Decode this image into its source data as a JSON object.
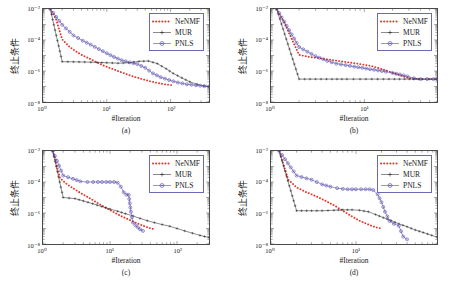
{
  "figure": {
    "ylabel": "终止条件",
    "xlabel": "#Iteration",
    "legend": [
      {
        "name": "NeNMF",
        "color": "#e8352a",
        "style": "dotted-thick",
        "marker": "none"
      },
      {
        "name": "MUR",
        "color": "#2a2a2a",
        "style": "solid-thin",
        "marker": "plus"
      },
      {
        "name": "PNLS",
        "color": "#4a3fa8",
        "style": "solid-thin",
        "marker": "circle"
      }
    ]
  },
  "chart_data": [
    {
      "type": "line",
      "panel": "(a)",
      "title": "",
      "xlabel": "#Iteration",
      "ylabel": "终止条件",
      "xscale": "log",
      "yscale": "log",
      "xlim": [
        1,
        400
      ],
      "ylim": [
        1e-08,
        0.01
      ],
      "xticks": [
        1,
        10,
        100
      ],
      "xticklabels": [
        "10⁰",
        "10¹",
        "10²"
      ],
      "yticks": [
        0.01,
        0.0001,
        1e-06,
        1e-08
      ],
      "yticklabels": [
        "10⁻²",
        "10⁻⁴",
        "10⁻⁶",
        "10⁻⁸"
      ],
      "grid": false,
      "legend_position": "upper-right",
      "series": [
        {
          "name": "NeNMF",
          "color": "#e8352a",
          "x": [
            1.3,
            1.6,
            2,
            2.6,
            3.3,
            4.2,
            5.5,
            7,
            9,
            12,
            16,
            21,
            27,
            36,
            47,
            62,
            80,
            105
          ],
          "y": [
            0.01,
            0.0022,
            0.00011,
            3.6e-05,
            1.8e-05,
            1e-05,
            6e-06,
            3.6e-06,
            2.2e-06,
            1.4e-06,
            9e-07,
            6e-07,
            4.2e-07,
            3e-07,
            2.2e-07,
            1.7e-07,
            1.4e-07,
            1.2e-07
          ]
        },
        {
          "name": "MUR",
          "color": "#2a2a2a",
          "x": [
            1.3,
            2,
            3,
            4.5,
            7,
            10,
            15,
            22,
            32,
            45,
            62,
            85,
            110,
            150,
            200,
            260,
            330,
            400
          ],
          "y": [
            0.01,
            4e-06,
            3.9e-06,
            3.8e-06,
            3.6e-06,
            3.4e-06,
            3.2e-06,
            3.4e-06,
            4.2e-06,
            4.4e-06,
            3e-06,
            1.4e-06,
            7e-07,
            3.6e-07,
            2e-07,
            1.4e-07,
            1.1e-07,
            1e-07
          ]
        },
        {
          "name": "PNLS",
          "color": "#4a3fa8",
          "x": [
            1.3,
            2,
            3,
            4.2,
            5.6,
            7.5,
            10,
            13,
            17,
            23,
            30,
            40,
            53,
            70,
            95,
            130,
            180,
            250,
            340,
            400
          ],
          "y": [
            0.01,
            0.00095,
            0.0002,
            9e-05,
            5e-05,
            2.6e-05,
            1.4e-05,
            8e-06,
            5e-06,
            3.6e-06,
            2.8e-06,
            1.6e-06,
            7e-07,
            4e-07,
            2.6e-07,
            1.8e-07,
            1.4e-07,
            1.2e-07,
            1.05e-07,
            1e-07
          ]
        }
      ]
    },
    {
      "type": "line",
      "panel": "(b)",
      "title": "",
      "xlabel": "#Iteration",
      "ylabel": "终止条件",
      "xscale": "log",
      "yscale": "log",
      "xlim": [
        1,
        60
      ],
      "ylim": [
        1e-08,
        0.01
      ],
      "xticks": [
        1,
        10
      ],
      "xticklabels": [
        "10⁰",
        "10¹"
      ],
      "yticks": [
        0.01,
        0.0001,
        1e-06,
        1e-08
      ],
      "yticklabels": [
        "10⁻²",
        "10⁻⁴",
        "10⁻⁶",
        "10⁻⁸"
      ],
      "grid": false,
      "legend_position": "upper-right",
      "series": [
        {
          "name": "NeNMF",
          "color": "#e8352a",
          "x": [
            1.15,
            1.4,
            1.7,
            2,
            2.6,
            3.4,
            4.4,
            5.6,
            7.2,
            9,
            11.5,
            14,
            17,
            21,
            26,
            32,
            40,
            50,
            60
          ],
          "y": [
            0.01,
            0.0012,
            9e-05,
            1.1e-05,
            8e-06,
            6.5e-06,
            5.2e-06,
            4.2e-06,
            3.4e-06,
            2.8e-06,
            2.2e-06,
            1.6e-06,
            1.1e-06,
            7e-07,
            4.5e-07,
            3.2e-07,
            3e-07,
            3e-07,
            3e-07
          ]
        },
        {
          "name": "MUR",
          "color": "#2a2a2a",
          "x": [
            1.15,
            2,
            3,
            4.5,
            6.5,
            9,
            12,
            16,
            21,
            27,
            34,
            42,
            50,
            60
          ],
          "y": [
            0.01,
            3e-07,
            3e-07,
            3e-07,
            3e-07,
            3e-07,
            3e-07,
            3e-07,
            3e-07,
            3e-07,
            3e-07,
            3e-07,
            3e-07,
            3e-07
          ]
        },
        {
          "name": "PNLS",
          "color": "#4a3fa8",
          "x": [
            1.15,
            2,
            3,
            4,
            5,
            6.3,
            7.8,
            9.5,
            11.5,
            14,
            17,
            20,
            24,
            29,
            34,
            40,
            47,
            55,
            60
          ],
          "y": [
            0.01,
            3.5e-05,
            9e-06,
            4.5e-06,
            3e-06,
            2.4e-06,
            1.9e-06,
            1.6e-06,
            1.3e-06,
            1.1e-06,
            9e-07,
            7.5e-07,
            6e-07,
            4.5e-07,
            3.4e-07,
            3e-07,
            3e-07,
            3e-07,
            3e-07
          ]
        }
      ]
    },
    {
      "type": "line",
      "panel": "(c)",
      "title": "",
      "xlabel": "#Iteration",
      "ylabel": "终止条件",
      "xscale": "log",
      "yscale": "log",
      "xlim": [
        1,
        300
      ],
      "ylim": [
        1e-08,
        0.01
      ],
      "xticks": [
        1,
        10,
        100
      ],
      "xticklabels": [
        "10⁰",
        "10¹",
        "10²"
      ],
      "yticks": [
        0.01,
        0.0001,
        1e-06,
        1e-08
      ],
      "yticklabels": [
        "10⁻²",
        "10⁻⁴",
        "10⁻⁶",
        "10⁻⁸"
      ],
      "grid": false,
      "legend_position": "upper-right",
      "series": [
        {
          "name": "NeNMF",
          "color": "#e8352a",
          "x": [
            1.4,
            1.8,
            2.2,
            2.8,
            3.6,
            4.6,
            6,
            7.6,
            9.6,
            12,
            15,
            19,
            24,
            30,
            38,
            46
          ],
          "y": [
            0.01,
            0.00018,
            8e-05,
            4e-05,
            2e-05,
            1.1e-05,
            5.5e-06,
            3e-06,
            1.7e-06,
            1e-06,
            6e-07,
            3.8e-07,
            2.4e-07,
            1.6e-07,
            1.1e-07,
            9e-08
          ]
        },
        {
          "name": "MUR",
          "color": "#2a2a2a",
          "x": [
            1.4,
            2,
            3,
            4,
            5.5,
            7.5,
            10,
            13,
            17,
            22,
            28,
            36,
            46,
            60,
            78,
            100,
            130,
            170,
            220,
            300
          ],
          "y": [
            0.01,
            1e-05,
            8.5e-06,
            6e-06,
            4e-06,
            2.6e-06,
            1.8e-06,
            1.3e-06,
            9e-07,
            6.5e-07,
            4.5e-07,
            3.2e-07,
            2.4e-07,
            1.8e-07,
            1.4e-07,
            1e-07,
            7e-08,
            5e-08,
            3.6e-08,
            2.6e-08
          ]
        },
        {
          "name": "PNLS",
          "color": "#4a3fa8",
          "x": [
            1.4,
            2,
            2.8,
            3.6,
            4.6,
            5.6,
            6.6,
            7.6,
            8.8,
            10,
            11.5,
            13,
            14.5,
            16,
            17.5,
            19,
            20.5,
            22,
            24,
            26,
            28,
            31
          ],
          "y": [
            0.01,
            0.00026,
            0.00016,
            0.00011,
            0.0001,
            0.0001,
            0.0001,
            0.0001,
            0.0001,
            0.0001,
            0.0001,
            9e-05,
            5e-05,
            2.2e-05,
            1.5e-05,
            1.5e-05,
            1.2e-06,
            2.4e-07,
            1.6e-07,
            1.2e-07,
            9e-08,
            7e-08
          ]
        }
      ]
    },
    {
      "type": "line",
      "panel": "(d)",
      "title": "",
      "xlabel": "#Iteration",
      "ylabel": "终止条件",
      "xscale": "log",
      "yscale": "log",
      "xlim": [
        1,
        90
      ],
      "ylim": [
        1e-08,
        0.01
      ],
      "xticks": [
        1,
        10
      ],
      "xticklabels": [
        "10⁰",
        "10¹"
      ],
      "yticks": [
        0.01,
        0.0001,
        1e-06,
        1e-08
      ],
      "yticklabels": [
        "10⁻²",
        "10⁻⁴",
        "10⁻⁶",
        "10⁻⁸"
      ],
      "grid": false,
      "legend_position": "upper-right",
      "series": [
        {
          "name": "NeNMF",
          "color": "#e8352a",
          "x": [
            1.25,
            1.6,
            2,
            2.6,
            3.4,
            4.4,
            5.6,
            7,
            9,
            11,
            14,
            17,
            20
          ],
          "y": [
            0.01,
            0.00014,
            4.5e-05,
            2.2e-05,
            1.2e-05,
            6e-06,
            3e-06,
            1.4e-06,
            6e-07,
            3.2e-07,
            1.8e-07,
            1.2e-07,
            1e-07
          ]
        },
        {
          "name": "MUR",
          "color": "#2a2a2a",
          "x": [
            1.25,
            2,
            3,
            4,
            5.5,
            7,
            9,
            11,
            14,
            17,
            21,
            26,
            32,
            40,
            50,
            62,
            78,
            90
          ],
          "y": [
            0.01,
            1.4e-06,
            1.4e-06,
            1.4e-06,
            1.5e-06,
            1.6e-06,
            1.6e-06,
            1.5e-06,
            1.2e-06,
            8e-07,
            5e-07,
            3.2e-07,
            2e-07,
            1.3e-07,
            8e-08,
            5.5e-08,
            3.6e-08,
            2.8e-08
          ]
        },
        {
          "name": "PNLS",
          "color": "#4a3fa8",
          "x": [
            1.25,
            2,
            3,
            4,
            5,
            6,
            7,
            8,
            9,
            10,
            11.5,
            13,
            14.5,
            16,
            18,
            20,
            22,
            25,
            28,
            32,
            36,
            40
          ],
          "y": [
            0.01,
            0.00026,
            0.00014,
            7e-05,
            5e-05,
            4e-05,
            3.6e-05,
            3.4e-05,
            3.4e-05,
            3.4e-05,
            3.4e-05,
            3.4e-05,
            3.4e-05,
            3e-05,
            1.6e-05,
            5e-06,
            1.2e-06,
            3e-07,
            2e-07,
            1.5e-07,
            3e-08,
            2e-08
          ]
        }
      ]
    }
  ]
}
